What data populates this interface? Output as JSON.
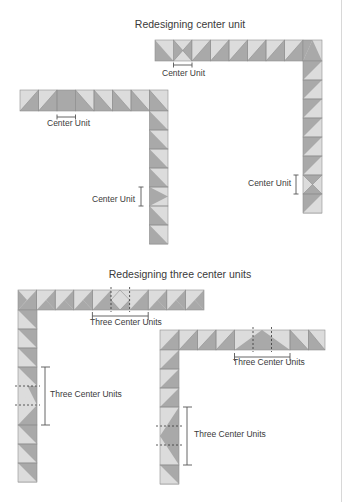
{
  "colors": {
    "light": "#dcdcdc",
    "dark": "#a9a9a9",
    "mid": "#bdbdbd",
    "stroke": "#8f8f8f",
    "text": "#3a3a3a",
    "dim": "#555555"
  },
  "sections": [
    {
      "title": "Redesigning center unit",
      "title_pos": [
        190,
        18
      ],
      "diagrams": [
        {
          "name": "top-right-border",
          "label": "Center Unit",
          "horizontal_label_pos": [
            162,
            68
          ],
          "vertical_label_pos": [
            248,
            178
          ]
        },
        {
          "name": "top-left-border",
          "label": "Center Unit",
          "horizontal_label_pos": [
            47,
            118
          ],
          "vertical_label_pos": [
            92,
            194
          ]
        }
      ]
    },
    {
      "title": "Redesigning three center units",
      "title_pos": [
        180,
        268
      ],
      "diagrams": [
        {
          "name": "bottom-left-border",
          "label": "Three Center Units",
          "horizontal_label_pos": [
            90,
            317
          ],
          "vertical_label_pos": [
            50,
            389
          ]
        },
        {
          "name": "bottom-right-border",
          "label": "Three Center Units",
          "horizontal_label_pos": [
            233,
            357
          ],
          "vertical_label_pos": [
            194,
            429
          ]
        }
      ]
    }
  ]
}
